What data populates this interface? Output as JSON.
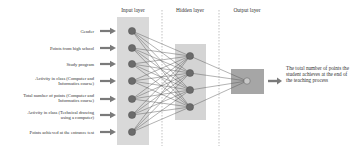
{
  "diagram": {
    "type": "neural-network",
    "layers": {
      "input": {
        "title": "Input layer",
        "nodes": 7
      },
      "hidden": {
        "title": "Hidden layer",
        "nodes": 4
      },
      "output": {
        "title": "Output layer",
        "nodes": 1
      }
    },
    "inputs": [
      {
        "label": "Gender"
      },
      {
        "label": "Points from high school"
      },
      {
        "label": "Study program"
      },
      {
        "label": "Activity in class (Computer and Informatics course)"
      },
      {
        "label": "Total number of points  (Computer and Informatics course)"
      },
      {
        "label": "Activity in class (Technical drawing using a computer)"
      },
      {
        "label": "Points achieved at the entrance test"
      }
    ],
    "output": {
      "label": "The total number of points the student achieves at the end of the teaching process"
    },
    "colors": {
      "box_input": "#d9d9d9",
      "box_hidden": "#d4d4d4",
      "box_output": "#a6a6a6",
      "node": "#6b6b6b",
      "node_output": "#c8c8c8",
      "edge": "#555555",
      "arrow": "#7a7a7a",
      "dashed": "#999999"
    }
  }
}
